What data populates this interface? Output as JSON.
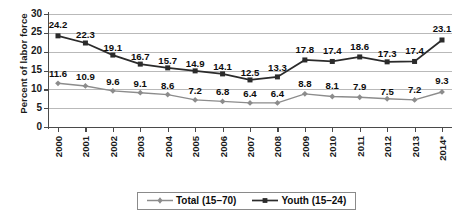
{
  "chart_data": {
    "type": "line",
    "title": "",
    "xlabel": "",
    "ylabel": "Percent of labor force",
    "ylim": [
      0,
      30
    ],
    "yticks": [
      0,
      5,
      10,
      15,
      20,
      25,
      30
    ],
    "grid": true,
    "legend_position": "bottom",
    "categories": [
      "2000",
      "2001",
      "2002",
      "2003",
      "2004",
      "2005",
      "2006",
      "2007",
      "2008",
      "2009",
      "2010",
      "2011",
      "2012",
      "2013",
      "2014*"
    ],
    "series": [
      {
        "name": "Total (15–70)",
        "marker": "diamond",
        "color": "#8c8c8c",
        "values": [
          11.6,
          10.9,
          9.6,
          9.1,
          8.6,
          7.2,
          6.8,
          6.4,
          6.4,
          8.8,
          8.1,
          7.9,
          7.5,
          7.2,
          9.3
        ]
      },
      {
        "name": "Youth (15–24)",
        "marker": "square",
        "color": "#2b2b2b",
        "values": [
          24.2,
          22.3,
          19.1,
          16.7,
          15.7,
          14.9,
          14.1,
          12.5,
          13.3,
          17.8,
          17.4,
          18.6,
          17.3,
          17.4,
          23.1
        ]
      }
    ]
  },
  "legend": {
    "items": [
      {
        "label": "Total (15–70)"
      },
      {
        "label": "Youth (15–24)"
      }
    ]
  },
  "colors": {
    "total_series": "#8c8c8c",
    "youth_series": "#2b2b2b",
    "gridline": "#b9b9b9",
    "axis": "#4a4a4a",
    "text": "#1a1a1a",
    "background": "#ffffff"
  }
}
